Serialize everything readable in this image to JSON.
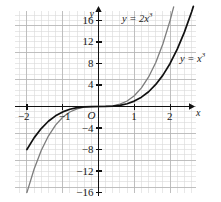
{
  "chart_data": {
    "type": "line",
    "title": "",
    "xlabel": "x",
    "ylabel": "y",
    "xlim": [
      -2.35,
      2.75
    ],
    "ylim": [
      -17.5,
      19.5
    ],
    "grid": true,
    "grid_minor_step_x": 0.2,
    "grid_minor_step_y": 1,
    "grid_major_step_x": 1,
    "grid_major_step_y": 5,
    "legend": "inline-labels",
    "x_ticks": [
      {
        "value": -2,
        "label": "−2"
      },
      {
        "value": -1,
        "label": "−1"
      },
      {
        "value": 1,
        "label": "1"
      },
      {
        "value": 2,
        "label": "2"
      }
    ],
    "y_ticks": [
      {
        "value": 16,
        "label": "16"
      },
      {
        "value": 12,
        "label": "12"
      },
      {
        "value": 8,
        "label": "8"
      },
      {
        "value": 4,
        "label": "4"
      },
      {
        "value": -4,
        "label": "−4"
      },
      {
        "value": -8,
        "label": "−8"
      },
      {
        "value": -12,
        "label": "−12"
      },
      {
        "value": -16,
        "label": "−16"
      }
    ],
    "origin_label": "O",
    "series": [
      {
        "name": "y = 2x^3",
        "label_html": "y = 2x<sup>3</sup>",
        "coefficient": 2,
        "exponent": 3,
        "color": "#7d7d7d",
        "points": [
          {
            "x": -2.0,
            "y": -16.0
          },
          {
            "x": -1.8,
            "y": -11.66
          },
          {
            "x": -1.6,
            "y": -8.19
          },
          {
            "x": -1.4,
            "y": -5.49
          },
          {
            "x": -1.2,
            "y": -3.46
          },
          {
            "x": -1.0,
            "y": -2.0
          },
          {
            "x": -0.8,
            "y": -1.02
          },
          {
            "x": -0.6,
            "y": -0.43
          },
          {
            "x": -0.4,
            "y": -0.13
          },
          {
            "x": -0.2,
            "y": -0.02
          },
          {
            "x": 0.0,
            "y": 0.0
          },
          {
            "x": 0.2,
            "y": 0.02
          },
          {
            "x": 0.4,
            "y": 0.13
          },
          {
            "x": 0.6,
            "y": 0.43
          },
          {
            "x": 0.8,
            "y": 1.02
          },
          {
            "x": 1.0,
            "y": 2.0
          },
          {
            "x": 1.2,
            "y": 3.46
          },
          {
            "x": 1.4,
            "y": 5.49
          },
          {
            "x": 1.6,
            "y": 8.19
          },
          {
            "x": 1.8,
            "y": 11.66
          },
          {
            "x": 2.0,
            "y": 16.0
          },
          {
            "x": 2.1,
            "y": 18.52
          }
        ]
      },
      {
        "name": "y = x^3",
        "label_html": "y = x<sup>3</sup>",
        "coefficient": 1,
        "exponent": 3,
        "color": "#111111",
        "points": [
          {
            "x": -2.0,
            "y": -8.0
          },
          {
            "x": -1.8,
            "y": -5.83
          },
          {
            "x": -1.6,
            "y": -4.1
          },
          {
            "x": -1.4,
            "y": -2.74
          },
          {
            "x": -1.2,
            "y": -1.73
          },
          {
            "x": -1.0,
            "y": -1.0
          },
          {
            "x": -0.8,
            "y": -0.51
          },
          {
            "x": -0.6,
            "y": -0.22
          },
          {
            "x": -0.4,
            "y": -0.06
          },
          {
            "x": -0.2,
            "y": -0.01
          },
          {
            "x": 0.0,
            "y": 0.0
          },
          {
            "x": 0.2,
            "y": 0.01
          },
          {
            "x": 0.4,
            "y": 0.06
          },
          {
            "x": 0.6,
            "y": 0.22
          },
          {
            "x": 0.8,
            "y": 0.51
          },
          {
            "x": 1.0,
            "y": 1.0
          },
          {
            "x": 1.2,
            "y": 1.73
          },
          {
            "x": 1.4,
            "y": 2.74
          },
          {
            "x": 1.6,
            "y": 4.1
          },
          {
            "x": 1.8,
            "y": 5.83
          },
          {
            "x": 2.0,
            "y": 8.0
          },
          {
            "x": 2.2,
            "y": 10.65
          },
          {
            "x": 2.4,
            "y": 13.82
          },
          {
            "x": 2.6,
            "y": 17.58
          },
          {
            "x": 2.65,
            "y": 18.61
          }
        ]
      }
    ],
    "annotations": [
      {
        "text_html": "y = 2x<sup>3</sup>",
        "x_px": 122,
        "y_px": 12
      },
      {
        "text_html": "y = x<sup>3</sup>",
        "x_px": 180,
        "y_px": 52
      }
    ],
    "colors": {
      "grid_minor": "#d8d8d8",
      "grid_major": "#b4b4b4",
      "axis": "#111111",
      "background": "#ffffff",
      "curve_light": "#7d7d7d",
      "curve_dark": "#111111"
    }
  }
}
